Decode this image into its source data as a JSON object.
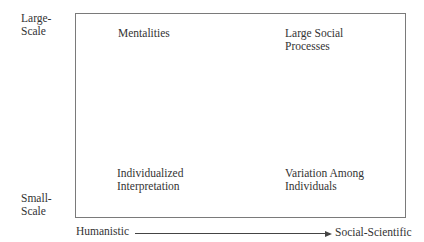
{
  "diagram": {
    "y_axis": {
      "top_label": [
        "Large-",
        "Scale"
      ],
      "bottom_label": [
        "Small-",
        "Scale"
      ]
    },
    "x_axis": {
      "left_label": "Humanistic",
      "right_label": "Social-Scientific"
    },
    "quadrants": {
      "top_left": [
        "Mentalities"
      ],
      "top_right": [
        "Large Social",
        "Processes"
      ],
      "bottom_left": [
        "Individualized",
        "Interpretation"
      ],
      "bottom_right": [
        "Variation Among",
        "Individuals"
      ]
    }
  }
}
